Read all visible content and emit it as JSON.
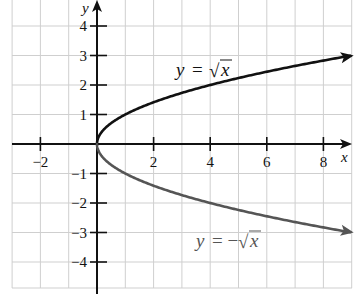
{
  "chart_data": {
    "type": "line",
    "title": "",
    "xlabel": "x",
    "ylabel": "y",
    "xlim": [
      -3,
      9
    ],
    "ylim": [
      -4.9,
      4.9
    ],
    "grid": true,
    "x_ticks": [
      -2,
      2,
      4,
      6,
      8
    ],
    "x_tick_labels": [
      "−2",
      "2",
      "4",
      "6",
      "8"
    ],
    "y_ticks": [
      4,
      3,
      2,
      1,
      -1,
      -2,
      -3,
      -4
    ],
    "y_tick_labels": [
      "4",
      "3",
      "2",
      "1",
      "−1",
      "−2",
      "−3",
      "−4"
    ],
    "series": [
      {
        "name": "y = √x",
        "label": "y = √x",
        "color": "#111111",
        "x": [
          0,
          0.25,
          1,
          2,
          4,
          6,
          8,
          9
        ],
        "values": [
          0,
          0.5,
          1,
          1.414,
          2,
          2.449,
          2.828,
          3
        ]
      },
      {
        "name": "y = −√x",
        "label": "y = −√x",
        "color": "#555555",
        "x": [
          0,
          0.25,
          1,
          2,
          4,
          6,
          8,
          9
        ],
        "values": [
          0,
          -0.5,
          -1,
          -1.414,
          -2,
          -2.449,
          -2.828,
          -3
        ]
      }
    ],
    "annotations": [
      {
        "text": "y = √x",
        "x": 3.4,
        "y": 2.35
      },
      {
        "text": "y = −√x",
        "x": 3.5,
        "y": -3.35
      }
    ]
  },
  "labels": {
    "x_axis": "x",
    "y_axis": "y",
    "upper_curve_y": "y",
    "upper_curve_eq": "=",
    "upper_curve_x": "x",
    "upper_curve_sqrt": "√",
    "lower_curve_y": "y",
    "lower_curve_eq": "= −",
    "lower_curve_x": "x",
    "lower_curve_sqrt": "√"
  },
  "colors": {
    "grid": "#cfcfcf",
    "axis": "#111111",
    "upper_curve": "#111111",
    "lower_curve": "#555555"
  }
}
